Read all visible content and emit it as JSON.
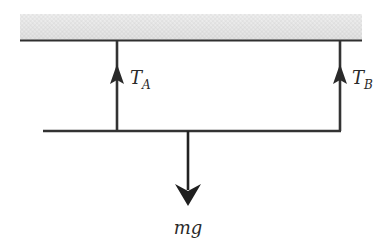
{
  "diagram": {
    "type": "free-body diagram",
    "ceiling": {
      "color": "#2f2f2f",
      "hatch_color": "#d8d8d8"
    },
    "ropes": [
      {
        "id": "A",
        "label_main": "T",
        "label_sub": "A",
        "direction": "up"
      },
      {
        "id": "B",
        "label_main": "T",
        "label_sub": "B",
        "direction": "up"
      }
    ],
    "weight": {
      "label": "mg",
      "direction": "down"
    },
    "colors": {
      "line": "#333333",
      "arrow": "#1f1f1f"
    }
  }
}
